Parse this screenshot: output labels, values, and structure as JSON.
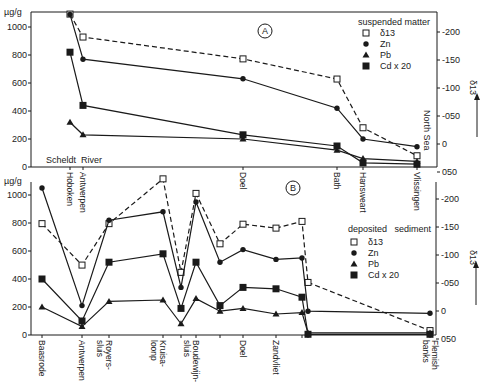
{
  "chart_data": [
    {
      "type": "line",
      "panel": "A",
      "title": "suspended matter",
      "xlabel": "Scheldt River → North Sea",
      "ylabel": "µg/g",
      "ylabel_right": "δ13",
      "ylim": [
        0,
        1100
      ],
      "ylim_right": [
        0.05,
        -0.23
      ],
      "yticks": [
        "0",
        "200",
        "400",
        "600",
        "800",
        "1000"
      ],
      "yticks_right": [
        "-200",
        "-150",
        "-100",
        "-050",
        "0",
        "050"
      ],
      "left_annotation": "Scheldt River",
      "right_annotation": "North Sea",
      "categories": [
        "Hoboken",
        "Antwerpen",
        "Doel",
        "Bath",
        "Hansweert",
        "Vlissingen"
      ],
      "x_px": [
        70,
        83,
        243,
        337,
        363,
        417
      ],
      "series": [
        {
          "name": "δ13",
          "marker": "open-square",
          "dashed": true,
          "axis": "right",
          "values": [
            -0.232,
            -0.191,
            -0.152,
            -0.116,
            -0.029,
            0.021
          ]
        },
        {
          "name": "Zn",
          "marker": "dot",
          "axis": "left",
          "values": [
            1090,
            770,
            630,
            420,
            200,
            145
          ]
        },
        {
          "name": "Pb",
          "marker": "triangle",
          "axis": "left",
          "values": [
            320,
            230,
            200,
            120,
            60,
            40
          ]
        },
        {
          "name": "Cd x 20",
          "marker": "filled-square",
          "axis": "left",
          "values": [
            820,
            440,
            230,
            150,
            30,
            20
          ]
        }
      ],
      "legend_position": "upper right"
    },
    {
      "type": "line",
      "panel": "B",
      "title": "deposited sediment",
      "ylabel": "µg/g",
      "ylabel_right": "δ13",
      "ylim": [
        0,
        1100
      ],
      "ylim_right": [
        0.05,
        -0.23
      ],
      "yticks": [
        "0",
        "200",
        "400",
        "600",
        "800",
        "1000"
      ],
      "yticks_right": [
        "-200",
        "-150",
        "-100",
        "-050",
        "0",
        "050"
      ],
      "categories": [
        "Baasrode",
        "Antwerpen",
        "Royers-sluis",
        "Kruisloop",
        "",
        "Boudewijn-sluis",
        "",
        "Doel",
        "Zandvliet",
        "",
        "",
        "Flemish banks"
      ],
      "x_px": [
        42,
        82,
        109,
        163,
        181,
        196,
        220,
        243,
        276,
        302,
        308,
        430
      ],
      "series": [
        {
          "name": "δ13",
          "marker": "open-square",
          "dashed": true,
          "axis": "right",
          "values": [
            -0.156,
            -0.082,
            -0.156,
            -0.236,
            -0.069,
            -0.21,
            -0.12,
            -0.155,
            -0.148,
            -0.16,
            -0.051,
            0.035
          ]
        },
        {
          "name": "Zn",
          "marker": "dot",
          "axis": "left",
          "values": [
            1050,
            210,
            820,
            880,
            340,
            950,
            520,
            610,
            540,
            550,
            170,
            155
          ]
        },
        {
          "name": "Pb",
          "marker": "triangle",
          "axis": "left",
          "values": [
            200,
            60,
            240,
            250,
            80,
            260,
            170,
            190,
            150,
            160,
            15,
            15
          ]
        },
        {
          "name": "Cd x 20",
          "marker": "filled-square",
          "axis": "left",
          "values": [
            400,
            100,
            520,
            580,
            190,
            520,
            210,
            340,
            330,
            270,
            5,
            5
          ]
        }
      ],
      "legend_position": "right"
    }
  ],
  "panelA": {
    "label": "A",
    "unit": "µg/g",
    "yticks": [
      "1000",
      "800",
      "600",
      "400",
      "200",
      "0"
    ],
    "rticks": [
      "-200",
      "-150",
      "-100",
      "-050",
      "0",
      "050"
    ],
    "legend_title": "suspended matter",
    "legend": [
      "δ13",
      "Zn",
      "Pb",
      "Cd x 20"
    ],
    "river": "Scheldt  River",
    "sea": "North Sea",
    "xlabels": [
      "Hoboken",
      "Antwerpen",
      "Doel",
      "Bath",
      "Hansweart",
      "Vlissingen"
    ]
  },
  "panelB": {
    "label": "B",
    "unit": "µg/g",
    "yticks": [
      "1000",
      "800",
      "600",
      "400",
      "200",
      "0"
    ],
    "rticks": [
      "-200",
      "-150",
      "-100",
      "-050",
      "0",
      "050"
    ],
    "legend_title": "deposited   sediment",
    "legend": [
      "δ13",
      "Zn",
      "Pb",
      "Cd x 20"
    ],
    "xlabels": [
      "Baasrode",
      "Antwerpen",
      "Royers-",
      "sluis",
      "Kruisa-",
      "loonp",
      "Boudewijn-",
      "sluis",
      "Doel",
      "Zandvliet",
      "Flemish",
      "banks"
    ]
  },
  "right_axis_label": "δ13"
}
